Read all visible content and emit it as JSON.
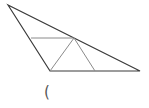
{
  "figure": {
    "outer_stroke_color": "#3a3a3a",
    "inner_stroke_color": "#8a8a8a"
  },
  "caption": {
    "text": "("
  }
}
